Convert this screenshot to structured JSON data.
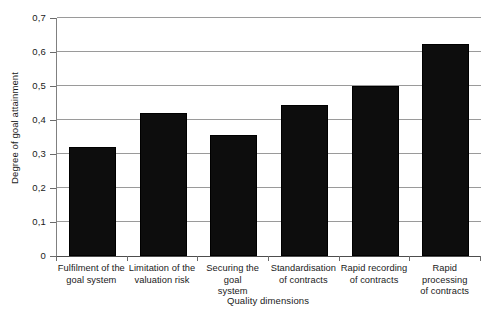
{
  "chart_data": {
    "type": "bar",
    "title": "",
    "xlabel": "Quality dimensions",
    "ylabel": "Degree of goal attainment",
    "categories": [
      "Fulfilment of the goal system",
      "Limitation of the valuation risk",
      "Securing the goal system",
      "Standardisation of contracts",
      "Rapid recording of contracts",
      "Rapid processing of contracts"
    ],
    "category_lines": [
      [
        "Fulfilment of the",
        "goal system"
      ],
      [
        "Limitation of the",
        "valuation risk"
      ],
      [
        "Securing the goal",
        "system"
      ],
      [
        "Standardisation",
        "of contracts"
      ],
      [
        "Rapid recording",
        "of contracts"
      ],
      [
        "Rapid processing",
        "of contracts"
      ]
    ],
    "values": [
      0.32,
      0.42,
      0.355,
      0.445,
      0.5,
      0.625
    ],
    "ylim": [
      0,
      0.7
    ],
    "ytick_values": [
      0,
      0.1,
      0.2,
      0.3,
      0.4,
      0.5,
      0.6,
      0.7
    ],
    "ytick_labels": [
      "0",
      "0,1",
      "0,2",
      "0,3",
      "0,4",
      "0,5",
      "0,6",
      "0,7"
    ],
    "grid": true,
    "legend": "none",
    "bar_color": "#0d0d0d",
    "grid_color": "#9a9a9a",
    "axis_color": "#4d4d4d",
    "decimal_separator": ","
  }
}
